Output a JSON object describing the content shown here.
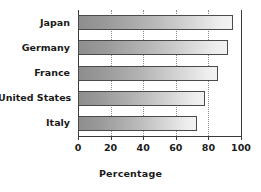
{
  "chart_data": {
    "type": "bar",
    "orientation": "horizontal",
    "title": "",
    "xlabel": "Percentage",
    "ylabel": "",
    "xlim": [
      0,
      100
    ],
    "xticks": [
      0,
      20,
      40,
      60,
      80,
      100
    ],
    "xtick_labels": [
      "0",
      "20",
      "40",
      "60",
      "80",
      "100"
    ],
    "grid": true,
    "gridlines_at": [
      20,
      40,
      60,
      80
    ],
    "legend": null,
    "categories": [
      "Japan",
      "Germany",
      "France",
      "United States",
      "Italy"
    ],
    "values": [
      95,
      92,
      86,
      78,
      73
    ],
    "bars": [
      {
        "category": "Japan",
        "value": 95
      },
      {
        "category": "Germany",
        "value": 92
      },
      {
        "category": "France",
        "value": 86
      },
      {
        "category": "United States",
        "value": 78
      },
      {
        "category": "Italy",
        "value": 73
      }
    ],
    "colors": {
      "bar_gradient_start": "#8e8e8e",
      "bar_gradient_end": "#f2f2f2",
      "bar_border": "#4a4a4a",
      "axis": "#3a3a3a",
      "gridline": "#8a8a8a",
      "text": "#1a1a1a",
      "background": "#ffffff"
    }
  }
}
